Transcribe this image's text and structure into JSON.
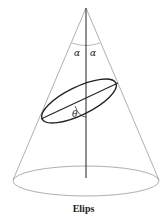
{
  "figure": {
    "caption": "Elips",
    "labels": {
      "alpha_left": "α",
      "alpha_right": "α",
      "theta": "θ"
    },
    "colors": {
      "cone_outline": "#9a9a9a",
      "axis": "#222222",
      "section": "#222222"
    }
  }
}
